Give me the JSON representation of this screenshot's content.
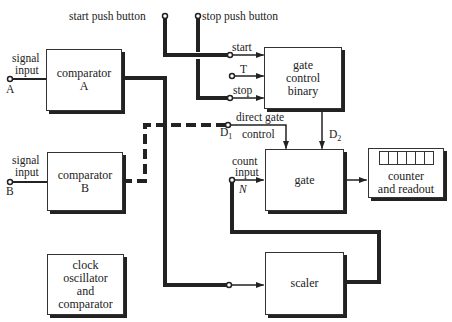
{
  "diagram": {
    "colors": {
      "ink": "#222222",
      "background": "#ffffff"
    },
    "top_labels": {
      "start_push_button": "start push button",
      "stop_push_button": "stop push button"
    },
    "inputs": {
      "a": {
        "label_line1": "signal",
        "label_line2": "input",
        "terminal": "A"
      },
      "b": {
        "label_line1": "signal",
        "label_line2": "input",
        "terminal": "B"
      }
    },
    "blocks": {
      "comparator_a": {
        "line1": "comparator",
        "line2": "A"
      },
      "comparator_b": {
        "line1": "comparator",
        "line2": "B"
      },
      "clock": {
        "line1": "clock",
        "line2": "oscillator",
        "line3": "and",
        "line4": "comparator"
      },
      "gate_control": {
        "line1": "gate",
        "line2": "control",
        "line3": "binary"
      },
      "gate": {
        "line1": "gate"
      },
      "counter": {
        "line1": "counter",
        "line2": "and readout",
        "digit_cells": 6
      },
      "scaler": {
        "line1": "scaler"
      }
    },
    "signal_labels": {
      "start": "start",
      "t": "T",
      "stop": "stop",
      "direct_gate": "direct gate",
      "control": "control",
      "d1": "D",
      "d1_sub": "1",
      "d2": "D",
      "d2_sub": "2",
      "count": "count",
      "input": "input",
      "n": "N"
    }
  }
}
